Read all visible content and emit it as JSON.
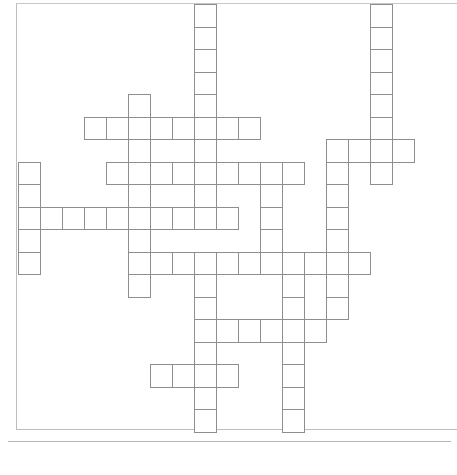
{
  "puzzle": {
    "type": "crossword-blank-grid",
    "cell_size_px": 22,
    "origin": {
      "x": 18,
      "y": 4
    },
    "row_height_px": 22.5,
    "line_color": "#8e8e8e",
    "frame_color": "#bdbdbd",
    "cells": [
      [
        0,
        8
      ],
      [
        1,
        8
      ],
      [
        2,
        8
      ],
      [
        3,
        8
      ],
      [
        4,
        8
      ],
      [
        5,
        8
      ],
      [
        6,
        8
      ],
      [
        7,
        8
      ],
      [
        8,
        8
      ],
      [
        9,
        8
      ],
      [
        0,
        16
      ],
      [
        1,
        16
      ],
      [
        2,
        16
      ],
      [
        3,
        16
      ],
      [
        4,
        16
      ],
      [
        5,
        16
      ],
      [
        6,
        16
      ],
      [
        7,
        16
      ],
      [
        4,
        5
      ],
      [
        5,
        3
      ],
      [
        5,
        4
      ],
      [
        5,
        5
      ],
      [
        5,
        6
      ],
      [
        5,
        7
      ],
      [
        5,
        9
      ],
      [
        5,
        10
      ],
      [
        6,
        5
      ],
      [
        6,
        14
      ],
      [
        6,
        15
      ],
      [
        6,
        17
      ],
      [
        7,
        4
      ],
      [
        7,
        5
      ],
      [
        7,
        6
      ],
      [
        7,
        7
      ],
      [
        7,
        9
      ],
      [
        7,
        10
      ],
      [
        7,
        11
      ],
      [
        7,
        12
      ],
      [
        7,
        14
      ],
      [
        7,
        0
      ],
      [
        8,
        0
      ],
      [
        8,
        5
      ],
      [
        8,
        11
      ],
      [
        8,
        14
      ],
      [
        9,
        0
      ],
      [
        9,
        1
      ],
      [
        9,
        2
      ],
      [
        9,
        3
      ],
      [
        9,
        4
      ],
      [
        9,
        5
      ],
      [
        9,
        6
      ],
      [
        9,
        7
      ],
      [
        9,
        9
      ],
      [
        9,
        11
      ],
      [
        9,
        14
      ],
      [
        10,
        0
      ],
      [
        10,
        5
      ],
      [
        10,
        11
      ],
      [
        10,
        14
      ],
      [
        11,
        0
      ],
      [
        11,
        5
      ],
      [
        11,
        6
      ],
      [
        11,
        7
      ],
      [
        11,
        8
      ],
      [
        11,
        9
      ],
      [
        11,
        10
      ],
      [
        11,
        11
      ],
      [
        11,
        12
      ],
      [
        11,
        13
      ],
      [
        11,
        14
      ],
      [
        11,
        15
      ],
      [
        12,
        5
      ],
      [
        12,
        8
      ],
      [
        12,
        12
      ],
      [
        12,
        14
      ],
      [
        13,
        8
      ],
      [
        13,
        12
      ],
      [
        13,
        14
      ],
      [
        14,
        8
      ],
      [
        14,
        9
      ],
      [
        14,
        10
      ],
      [
        14,
        11
      ],
      [
        14,
        12
      ],
      [
        14,
        13
      ],
      [
        15,
        8
      ],
      [
        15,
        12
      ],
      [
        16,
        6
      ],
      [
        16,
        7
      ],
      [
        16,
        8
      ],
      [
        16,
        9
      ],
      [
        16,
        12
      ],
      [
        17,
        8
      ],
      [
        17,
        12
      ],
      [
        18,
        8
      ],
      [
        18,
        12
      ]
    ]
  }
}
